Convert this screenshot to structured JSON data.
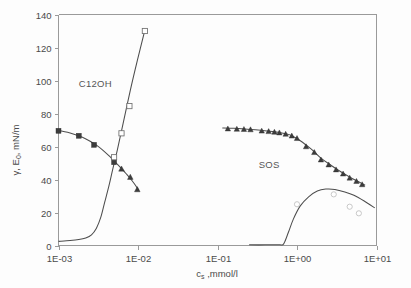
{
  "chart_data": {
    "type": "line",
    "title": "",
    "xlabel": "c_s , mmol/l",
    "xlabel_main": "c",
    "xlabel_sub": "s",
    "xlabel_rest": " ,mmol/l",
    "ylabel": "γ, E₀, mN/m",
    "ylabel_parts": [
      "γ",
      ", E",
      "0",
      ", mN/m"
    ],
    "xscale": "log",
    "xlim": [
      0.001,
      10
    ],
    "ylim": [
      0,
      140
    ],
    "xticks": [
      "1E-03",
      "1E-02",
      "1E-01",
      "1E+00",
      "1E+01"
    ],
    "xtick_values": [
      0.001,
      0.01,
      0.1,
      1,
      10
    ],
    "yticks": [
      "0",
      "20",
      "40",
      "60",
      "80",
      "100",
      "120",
      "140"
    ],
    "ytick_values": [
      0,
      20,
      40,
      60,
      80,
      100,
      120,
      140
    ],
    "grid": false,
    "legend_position": "inline-annotations",
    "annotations": [
      {
        "text": "C12OH",
        "x": 0.0018,
        "y": 96
      },
      {
        "text": "SOS",
        "x": 0.33,
        "y": 47
      }
    ],
    "series": [
      {
        "name": "C12OH surface tension",
        "marker": "filled-square-triangle",
        "label": "C12OH",
        "x": [
          0.001,
          0.0018,
          0.0028,
          0.005,
          0.0062,
          0.008,
          0.0098
        ],
        "y": [
          69.5,
          66.5,
          61.0,
          50.5,
          46.5,
          41.5,
          34.0
        ]
      },
      {
        "name": "C12OH surface elasticity",
        "marker": "open-square",
        "label": "C12OH E0",
        "x": [
          0.005,
          0.0062,
          0.0078,
          0.0122
        ],
        "y": [
          53.5,
          68.0,
          84.5,
          130.0
        ]
      },
      {
        "name": "SOS surface tension",
        "marker": "filled-triangle",
        "label": "SOS",
        "x": [
          0.135,
          0.175,
          0.215,
          0.26,
          0.36,
          0.44,
          0.52,
          0.6,
          0.72,
          0.86,
          1.0,
          1.3,
          1.65,
          2.0,
          2.5,
          3.1,
          3.8,
          4.6,
          5.6,
          6.6
        ],
        "y": [
          70.8,
          70.6,
          70.5,
          70.3,
          69.5,
          69.2,
          68.8,
          68.4,
          67.6,
          66.5,
          65.0,
          60.0,
          56.5,
          52.0,
          49.0,
          46.0,
          43.5,
          41.0,
          39.0,
          37.0
        ]
      },
      {
        "name": "SOS surface elasticity",
        "marker": "open-circle-faint",
        "label": "SOS E0",
        "x": [
          1.0,
          2.9,
          4.6,
          6.0
        ],
        "y": [
          25.0,
          31.0,
          23.5,
          19.5
        ]
      }
    ],
    "curves": [
      {
        "name": "C12OH surface tension fit",
        "points_x": [
          0.001,
          0.0013,
          0.0016,
          0.002,
          0.0025,
          0.003,
          0.0036,
          0.0043,
          0.005,
          0.006,
          0.007,
          0.008,
          0.009,
          0.0102
        ],
        "points_y": [
          69.8,
          68.6,
          67.3,
          65.6,
          63.2,
          60.8,
          57.8,
          54.4,
          51.2,
          47.4,
          43.8,
          40.6,
          37.4,
          33.5
        ]
      },
      {
        "name": "C12OH surface elasticity fit",
        "points_x": [
          0.001,
          0.0014,
          0.0018,
          0.0022,
          0.0026,
          0.003,
          0.0034,
          0.0038,
          0.0043,
          0.0048,
          0.0055,
          0.0065,
          0.008,
          0.0098,
          0.0122
        ],
        "points_y": [
          2.5,
          3.0,
          3.6,
          4.6,
          6.5,
          10.5,
          17.0,
          26.0,
          36.0,
          46.0,
          58.0,
          74.0,
          94.0,
          112.0,
          130.5
        ]
      },
      {
        "name": "SOS surface tension fit",
        "points_x": [
          0.115,
          0.16,
          0.22,
          0.3,
          0.42,
          0.58,
          0.8,
          1.1,
          1.5,
          2.0,
          2.7,
          3.6,
          4.8,
          6.4,
          7.2
        ],
        "points_y": [
          71.2,
          71.0,
          70.6,
          70.1,
          69.4,
          68.6,
          67.2,
          63.5,
          58.5,
          53.0,
          48.5,
          44.5,
          41.0,
          37.8,
          36.5
        ]
      },
      {
        "name": "SOS surface elasticity fit",
        "points_x": [
          0.25,
          0.4,
          0.6,
          0.68,
          0.78,
          0.9,
          1.1,
          1.4,
          1.8,
          2.3,
          3.0,
          4.0,
          5.2,
          7.0,
          9.5
        ],
        "points_y": [
          0.4,
          0.4,
          0.5,
          1.0,
          8.0,
          16.0,
          24.0,
          29.5,
          33.0,
          34.2,
          34.0,
          32.5,
          30.5,
          27.0,
          22.8
        ]
      }
    ]
  }
}
